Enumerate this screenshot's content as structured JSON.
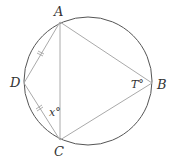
{
  "diagram": {
    "circle": {
      "cx": 88,
      "cy": 81,
      "r": 64,
      "stroke": "#555555"
    },
    "points": {
      "A": {
        "label": "A",
        "x": 60,
        "y": 22
      },
      "B": {
        "label": "B",
        "x": 152,
        "y": 83
      },
      "C": {
        "label": "C",
        "x": 60,
        "y": 140
      },
      "D": {
        "label": "D",
        "x": 24,
        "y": 83
      }
    },
    "angles": {
      "T": {
        "label": "T°"
      },
      "x": {
        "label": "x°"
      }
    },
    "segments": [
      "AB",
      "BC",
      "AC",
      "AD",
      "DC"
    ],
    "equal_marks": [
      "AD",
      "DC"
    ],
    "line_color": "#aaaaaa"
  }
}
